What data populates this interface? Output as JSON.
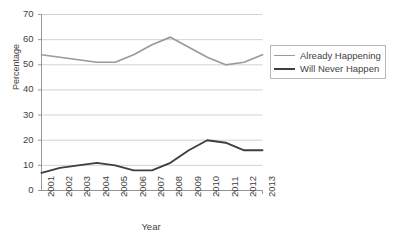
{
  "chart_data": {
    "type": "line",
    "title": "",
    "xlabel": "Year",
    "ylabel": "Percentage",
    "categories": [
      "2001",
      "2002",
      "2003",
      "2004",
      "2005",
      "2006",
      "2007",
      "2008",
      "2009",
      "2010",
      "2011",
      "2012",
      "2013"
    ],
    "x": [
      2001,
      2002,
      2003,
      2004,
      2005,
      2006,
      2007,
      2008,
      2009,
      2010,
      2011,
      2012,
      2013
    ],
    "ylim": [
      0,
      70
    ],
    "yticks": [
      0,
      10,
      20,
      30,
      40,
      50,
      60,
      70
    ],
    "grid": "horizontal",
    "legend_position": "right",
    "series": [
      {
        "name": "Already Happening",
        "color": "#9a9a9a",
        "values": [
          54,
          53,
          52,
          51,
          51,
          54,
          58,
          61,
          57,
          53,
          50,
          51,
          54
        ]
      },
      {
        "name": "Will Never Happen",
        "color": "#3f3f3f",
        "values": [
          7,
          9,
          10,
          11,
          10,
          8,
          8,
          11,
          16,
          20,
          19,
          16,
          16
        ]
      }
    ]
  },
  "axes": {
    "y_title": "Percentage",
    "x_title": "Year",
    "y_tick_labels": [
      "70",
      "60",
      "50",
      "40",
      "30",
      "20",
      "10",
      "0"
    ],
    "x_tick_labels": [
      "2001",
      "2002",
      "2003",
      "2004",
      "2005",
      "2006",
      "2007",
      "2008",
      "2009",
      "2010",
      "2011",
      "2012",
      "2013"
    ]
  },
  "legend": {
    "entries": [
      {
        "label": "Already Happening",
        "color": "#9a9a9a"
      },
      {
        "label": "Will Never Happen",
        "color": "#3f3f3f"
      }
    ]
  },
  "colors": {
    "series_already_happening": "#9a9a9a",
    "series_will_never_happen": "#3f3f3f",
    "gridline": "#c8c8c8",
    "axis": "#8c8c8c",
    "text": "#3f3f3f",
    "background": "#ffffff"
  }
}
